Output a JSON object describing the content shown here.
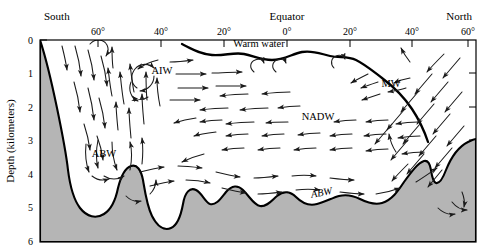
{
  "figure": {
    "axes": {
      "x": {
        "label_left": "South",
        "label_right": "North",
        "label_center": "Equator",
        "ticks": [
          {
            "label": "60°",
            "x_px": 98
          },
          {
            "label": "40°",
            "x_px": 161
          },
          {
            "label": "20°",
            "x_px": 224
          },
          {
            "label": "0°",
            "x_px": 287
          },
          {
            "label": "20°",
            "x_px": 350
          },
          {
            "label": "40°",
            "x_px": 412
          },
          {
            "label": "60°",
            "x_px": 468
          }
        ]
      },
      "y": {
        "label": "Depth (kilometers)",
        "ticks": [
          "0",
          "1",
          "2",
          "3",
          "4",
          "5",
          "6"
        ],
        "units": "kilometers",
        "min": 0,
        "max": 6
      }
    },
    "water_masses": [
      {
        "name": "Warm water",
        "abbr": "Warm water",
        "x_px": 259,
        "y_px": 47,
        "style": "upright"
      },
      {
        "name": "Antarctic Intermediate Water",
        "abbr": "AIW",
        "x_px": 162,
        "y_px": 74,
        "style": "upright"
      },
      {
        "name": "Mediterranean Water",
        "abbr": "MW",
        "x_px": 391,
        "y_px": 87,
        "style": "upright"
      },
      {
        "name": "North Atlantic Deep Water",
        "abbr": "NADW",
        "x_px": 318,
        "y_px": 120,
        "style": "upright"
      },
      {
        "name": "Antarctic Bottom Water",
        "abbr": "ABW",
        "x_px": 104,
        "y_px": 157,
        "style": "upright"
      },
      {
        "name": "Antarctic Bottom Water",
        "abbr": "ABW",
        "x_px": 322,
        "y_px": 196,
        "style": "italic"
      }
    ],
    "colors": {
      "seafloor_fill": "#b5b5b5",
      "seafloor_stroke": "#000000",
      "frame": "#000000",
      "thermocline": "#000000",
      "arrow": "#1a1a1a",
      "background": "#ffffff"
    }
  }
}
